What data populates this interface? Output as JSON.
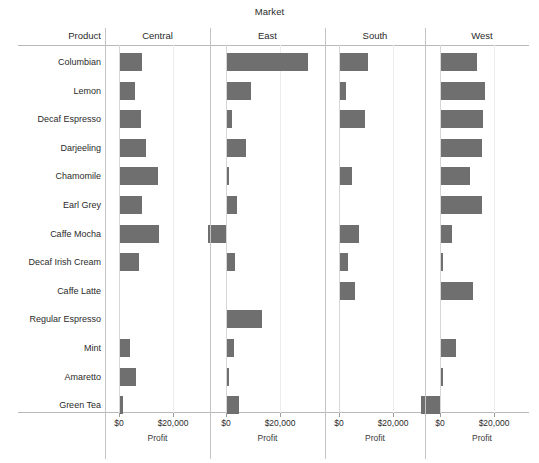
{
  "chart_data": {
    "type": "bar",
    "orientation": "horizontal",
    "title": "Market",
    "xlabel": "Profit",
    "ylabel": "Product",
    "row_header": "Product",
    "panel_header": "Market",
    "grid": false,
    "legend": null,
    "bar_color": "#6f6f6f",
    "xlim": [
      -8000,
      34000
    ],
    "xticks": [
      0,
      20000
    ],
    "xticklabels": [
      "$0",
      "$20,000"
    ],
    "categories": [
      "Columbian",
      "Lemon",
      "Decaf Espresso",
      "Darjeeling",
      "Chamomile",
      "Earl Grey",
      "Caffe Mocha",
      "Decaf Irish Cream",
      "Caffe Latte",
      "Regular Espresso",
      "Mint",
      "Amaretto",
      "Green Tea"
    ],
    "panels": [
      "Central",
      "East",
      "South",
      "West"
    ],
    "series": [
      {
        "name": "Central",
        "values": [
          8100,
          5400,
          7600,
          9600,
          13900,
          8100,
          14400,
          7200,
          0,
          0,
          3800,
          5800,
          1000
        ]
      },
      {
        "name": "East",
        "values": [
          30000,
          9000,
          2000,
          7000,
          900,
          3600,
          -6500,
          3000,
          0,
          12900,
          2700,
          800,
          4300
        ]
      },
      {
        "name": "South",
        "values": [
          10500,
          2200,
          9100,
          0,
          4300,
          0,
          7000,
          3000,
          5400,
          0,
          0,
          0,
          0
        ]
      },
      {
        "name": "West",
        "values": [
          13400,
          16200,
          15500,
          15200,
          10800,
          15000,
          4100,
          900,
          12000,
          0,
          5500,
          700,
          -7000
        ]
      }
    ]
  },
  "layout": {
    "label_col_width": 101,
    "panel_lefts": [
      105,
      210,
      325,
      425
    ],
    "panel_widths": [
      105,
      115,
      100,
      114
    ],
    "zero_offsets": [
      14,
      16,
      14,
      15
    ],
    "px_per_20000": 54,
    "row_top": 53,
    "row_pitch": 28.6,
    "bar_height": 18
  }
}
